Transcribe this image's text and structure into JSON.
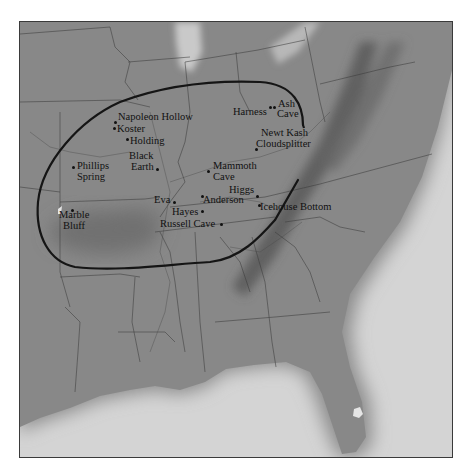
{
  "map": {
    "region": "Eastern United States",
    "colors": {
      "land": "#888888",
      "sea": "#d4d4d4",
      "boundary_loop": "#151515",
      "borders": "#3c3c3c",
      "labels": "#111111"
    }
  },
  "sites": [
    {
      "id": "napoleon-hollow",
      "label": "Napoleon Hollow",
      "lines": [
        "Napoleon Hollow"
      ],
      "dot": [
        115,
        121
      ],
      "text": [
        118,
        111
      ]
    },
    {
      "id": "koster",
      "label": "Koster",
      "lines": [
        "Koster"
      ],
      "dot": [
        114,
        126
      ],
      "text": [
        117,
        123
      ]
    },
    {
      "id": "holding",
      "label": "Holding",
      "lines": [
        "Holding"
      ],
      "dot": [
        127,
        138
      ],
      "text": [
        129,
        135
      ]
    },
    {
      "id": "black-earth",
      "label": "Black Earth",
      "lines": [
        "Black",
        "Earth"
      ],
      "dot": [
        157,
        168
      ],
      "text": [
        129,
        150
      ]
    },
    {
      "id": "phillips-spring",
      "label": "Phillips Spring",
      "lines": [
        "Phillips",
        "Spring"
      ],
      "dot": [
        73,
        165
      ],
      "text": [
        77,
        160
      ]
    },
    {
      "id": "marble-bluff",
      "label": "Marble Bluff",
      "lines": [
        "Marble",
        "Bluff"
      ],
      "dot": [
        72,
        209
      ],
      "text": [
        59,
        209
      ]
    },
    {
      "id": "mammoth-cave",
      "label": "Mammoth Cave",
      "lines": [
        "Mammoth",
        "Cave"
      ],
      "dot": [
        208,
        170
      ],
      "text": [
        213,
        160
      ]
    },
    {
      "id": "eva",
      "label": "Eva",
      "lines": [
        "Eva"
      ],
      "dot": [
        174,
        201
      ],
      "text": [
        154,
        193
      ]
    },
    {
      "id": "anderson",
      "label": "Anderson",
      "lines": [
        "Anderson"
      ],
      "dot": [
        202,
        195
      ],
      "text": [
        204,
        193
      ]
    },
    {
      "id": "hayes",
      "label": "Hayes",
      "lines": [
        "Hayes"
      ],
      "dot": [
        202,
        210
      ],
      "text": [
        172,
        205
      ]
    },
    {
      "id": "russell-cave",
      "label": "Russell Cave",
      "lines": [
        "Russell Cave"
      ],
      "dot": [
        221,
        223
      ],
      "text": [
        160,
        217
      ]
    },
    {
      "id": "higgs",
      "label": "Higgs",
      "lines": [
        "Higgs"
      ],
      "dot": [
        257,
        195
      ],
      "text": [
        229,
        183
      ]
    },
    {
      "id": "icehouse-bottom",
      "label": "Icehouse Bottom",
      "lines": [
        "Icehouse Bottom"
      ],
      "dot": [
        259,
        204
      ],
      "text": [
        260,
        200
      ]
    },
    {
      "id": "harness",
      "label": "Harness",
      "lines": [
        "Harness"
      ],
      "dot": [
        270,
        106
      ],
      "text": [
        233,
        105
      ]
    },
    {
      "id": "ash-cave",
      "label": "Ash Cave",
      "lines": [
        "Ash",
        "Cave"
      ],
      "dot": [
        274,
        106
      ],
      "text": [
        277,
        97
      ]
    },
    {
      "id": "newt-kash",
      "label": "Newt Kash",
      "lines": [
        "Newt Kash"
      ],
      "dot": null,
      "text": [
        261,
        126
      ]
    },
    {
      "id": "cloudsplitter",
      "label": "Cloudsplitter",
      "lines": [
        "Cloudsplitter"
      ],
      "dot": [
        256,
        147
      ],
      "text": [
        256,
        137
      ]
    }
  ]
}
